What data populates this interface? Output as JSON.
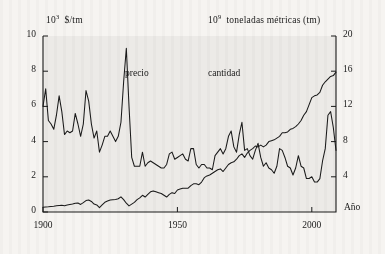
{
  "chart_data": {
    "type": "line",
    "title": "",
    "subtitle": "",
    "xlabel": "Año",
    "ylabel_left": "10³ $/tm",
    "ylabel_right": "10⁹ toneladas métricas (tm)",
    "axis_left_unit_mantissa": "10",
    "axis_left_unit_exponent": "3",
    "axis_left_unit_rest": "$/tm",
    "axis_right_unit_mantissa": "10",
    "axis_right_unit_exponent": "9",
    "axis_right_unit_rest": "toneladas métricas (tm)",
    "xlim": [
      1900,
      2009
    ],
    "ylim_left": [
      0,
      10
    ],
    "ylim_right": [
      0,
      20
    ],
    "xticks": [
      1900,
      1950,
      2000
    ],
    "xticklabels": [
      "1900",
      "1950",
      "2000"
    ],
    "yticks_left": [
      0,
      2,
      4,
      6,
      8,
      10
    ],
    "yticklabels_left": [
      "0",
      "2",
      "4",
      "6",
      "8",
      "10"
    ],
    "yticks_right": [
      4,
      8,
      12,
      16,
      20
    ],
    "yticklabels_right": [
      "4",
      "8",
      "12",
      "16",
      "20"
    ],
    "grid": false,
    "legend_position": "inline-annotations",
    "annotations": [
      {
        "text": "precio",
        "x": 1930,
        "y_left": 7.6
      },
      {
        "text": "cantidad",
        "x": 1962,
        "y_left": 7.6
      },
      {
        "text": "Año",
        "x": 2011,
        "y_left": 0.35
      }
    ],
    "line_color": "#1a1a1a",
    "background_color": "#f6f4f1",
    "plot_area_color": "#e4e2de",
    "series": [
      {
        "name": "precio",
        "axis": "left",
        "unit": "10³ $/tm",
        "x": [
          1900,
          1901,
          1902,
          1903,
          1904,
          1905,
          1906,
          1907,
          1908,
          1909,
          1910,
          1911,
          1912,
          1913,
          1914,
          1915,
          1916,
          1917,
          1918,
          1919,
          1920,
          1921,
          1922,
          1923,
          1924,
          1925,
          1926,
          1927,
          1928,
          1929,
          1930,
          1931,
          1932,
          1933,
          1934,
          1935,
          1936,
          1937,
          1938,
          1939,
          1940,
          1941,
          1942,
          1943,
          1944,
          1945,
          1946,
          1947,
          1948,
          1949,
          1950,
          1951,
          1952,
          1953,
          1954,
          1955,
          1956,
          1957,
          1958,
          1959,
          1960,
          1961,
          1962,
          1963,
          1964,
          1965,
          1966,
          1967,
          1968,
          1969,
          1970,
          1971,
          1972,
          1973,
          1974,
          1975,
          1976,
          1977,
          1978,
          1979,
          1980,
          1981,
          1982,
          1983,
          1984,
          1985,
          1986,
          1987,
          1988,
          1989,
          1990,
          1991,
          1992,
          1993,
          1994,
          1995,
          1996,
          1997,
          1998,
          1999,
          2000,
          2001,
          2002,
          2003,
          2004,
          2005,
          2006,
          2007,
          2008,
          2009
        ],
        "values": [
          6.0,
          7.0,
          5.2,
          5.0,
          4.7,
          5.5,
          6.6,
          5.7,
          4.4,
          4.6,
          4.5,
          4.6,
          5.6,
          5.0,
          4.3,
          5.0,
          6.9,
          6.3,
          5.0,
          4.2,
          4.6,
          3.4,
          3.8,
          4.3,
          4.3,
          4.6,
          4.3,
          4.0,
          4.3,
          5.1,
          7.4,
          9.3,
          6.0,
          3.1,
          2.6,
          2.6,
          2.6,
          3.4,
          2.6,
          2.8,
          2.9,
          2.8,
          2.7,
          2.6,
          2.5,
          2.5,
          2.7,
          3.3,
          3.4,
          3.0,
          3.1,
          3.2,
          3.3,
          3.0,
          2.9,
          3.6,
          3.6,
          2.7,
          2.5,
          2.7,
          2.7,
          2.5,
          2.5,
          2.4,
          3.2,
          3.4,
          3.6,
          3.3,
          3.6,
          4.3,
          4.6,
          3.7,
          3.4,
          4.4,
          5.1,
          3.5,
          3.6,
          3.2,
          3.0,
          3.5,
          3.9,
          3.1,
          2.6,
          2.8,
          2.5,
          2.4,
          2.2,
          2.6,
          3.6,
          3.5,
          3.1,
          2.6,
          2.5,
          2.1,
          2.5,
          3.2,
          2.6,
          2.5,
          1.9,
          1.9,
          2.0,
          1.7,
          1.7,
          1.9,
          2.9,
          3.6,
          5.5,
          5.7,
          4.8,
          3.5
        ]
      },
      {
        "name": "cantidad",
        "axis": "right",
        "unit": "10⁹ toneladas métricas (tm)",
        "x": [
          1900,
          1901,
          1902,
          1903,
          1904,
          1905,
          1906,
          1907,
          1908,
          1909,
          1910,
          1911,
          1912,
          1913,
          1914,
          1915,
          1916,
          1917,
          1918,
          1919,
          1920,
          1921,
          1922,
          1923,
          1924,
          1925,
          1926,
          1927,
          1928,
          1929,
          1930,
          1931,
          1932,
          1933,
          1934,
          1935,
          1936,
          1937,
          1938,
          1939,
          1940,
          1941,
          1942,
          1943,
          1944,
          1945,
          1946,
          1947,
          1948,
          1949,
          1950,
          1951,
          1952,
          1953,
          1954,
          1955,
          1956,
          1957,
          1958,
          1959,
          1960,
          1961,
          1962,
          1963,
          1964,
          1965,
          1966,
          1967,
          1968,
          1969,
          1970,
          1971,
          1972,
          1973,
          1974,
          1975,
          1976,
          1977,
          1978,
          1979,
          1980,
          1981,
          1982,
          1983,
          1984,
          1985,
          1986,
          1987,
          1988,
          1989,
          1990,
          1991,
          1992,
          1993,
          1994,
          1995,
          1996,
          1997,
          1998,
          1999,
          2000,
          2001,
          2002,
          2003,
          2004,
          2005,
          2006,
          2007,
          2008,
          2009
        ],
        "values": [
          0.55,
          0.58,
          0.6,
          0.63,
          0.66,
          0.7,
          0.74,
          0.76,
          0.72,
          0.8,
          0.86,
          0.9,
          1.0,
          1.02,
          0.86,
          1.06,
          1.3,
          1.36,
          1.2,
          0.9,
          0.8,
          0.5,
          0.8,
          1.1,
          1.24,
          1.36,
          1.4,
          1.42,
          1.5,
          1.72,
          1.4,
          1.0,
          0.7,
          0.9,
          1.1,
          1.4,
          1.6,
          1.9,
          1.7,
          2.0,
          2.3,
          2.4,
          2.3,
          2.2,
          2.1,
          1.9,
          1.7,
          2.0,
          2.2,
          2.1,
          2.5,
          2.6,
          2.7,
          2.7,
          2.7,
          3.0,
          3.2,
          3.2,
          3.1,
          3.4,
          3.9,
          4.1,
          4.2,
          4.4,
          4.6,
          4.8,
          4.9,
          4.6,
          5.0,
          5.4,
          5.6,
          5.7,
          6.0,
          6.4,
          6.6,
          6.2,
          6.7,
          7.0,
          7.2,
          7.5,
          7.4,
          7.6,
          7.4,
          7.6,
          8.0,
          8.1,
          8.2,
          8.4,
          8.6,
          9.0,
          9.0,
          9.1,
          9.4,
          9.5,
          9.7,
          10.0,
          10.4,
          11.0,
          11.4,
          12.2,
          13.0,
          13.2,
          13.3,
          13.6,
          14.4,
          14.8,
          15.1,
          15.4,
          15.5,
          15.9
        ]
      }
    ]
  }
}
